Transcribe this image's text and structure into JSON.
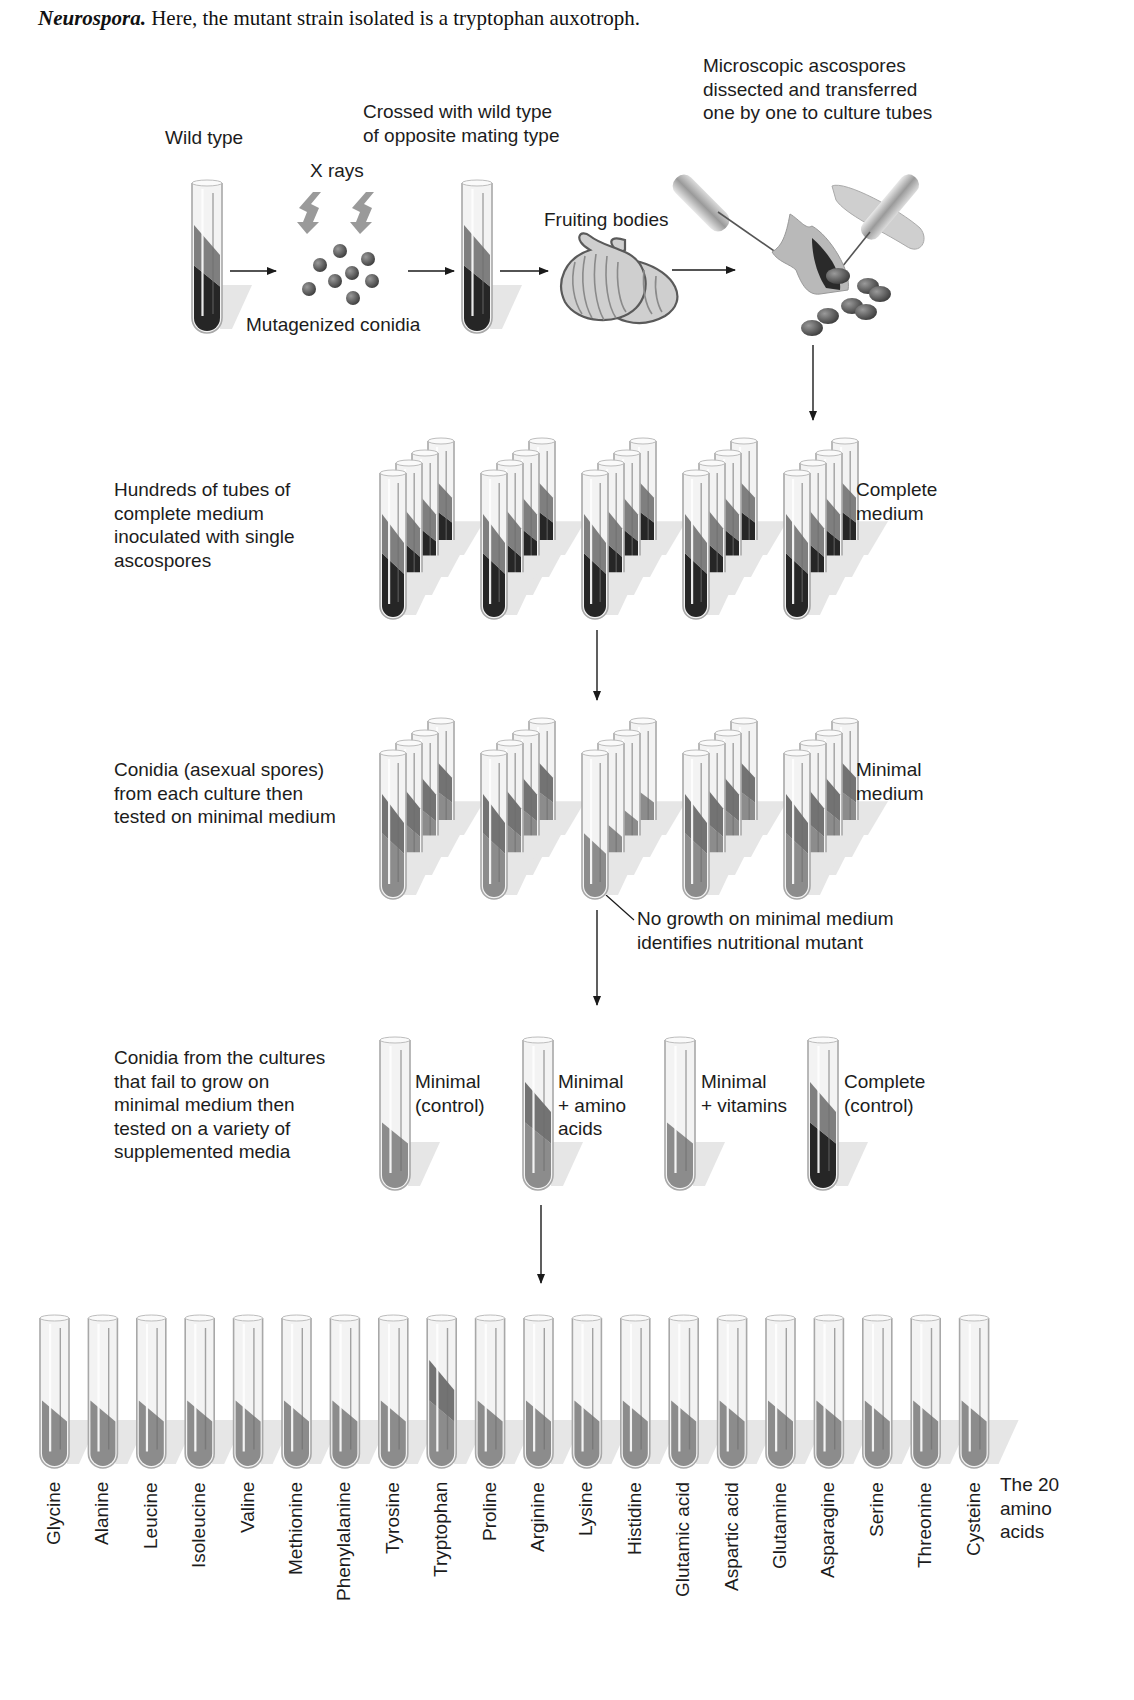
{
  "caption": {
    "italic_bold": "Neurospora.",
    "text": " Here, the mutant strain isolated is a tryptophan auxotroph."
  },
  "step1": {
    "wild_type_label": "Wild type",
    "xrays_label": "X rays",
    "mutagenized_label": "Mutagenized conidia",
    "crossed_label": "Crossed with wild type\nof opposite mating type",
    "fruiting_label": "Fruiting bodies",
    "dissect_label": "Microscopic ascospores\ndissected and transferred\none by one to culture tubes"
  },
  "step2": {
    "description": "Hundreds of tubes of\ncomplete medium\ninoculated with single\nascospores",
    "medium_label": "Complete\nmedium",
    "cluster_count": 5
  },
  "step3": {
    "description": "Conidia (asexual spores)\nfrom each culture then\ntested on minimal medium",
    "medium_label": "Minimal\nmedium",
    "note": "No growth on minimal medium\nidentifies nutritional mutant"
  },
  "step4": {
    "description": "Conidia from the cultures\nthat fail to grow on\nminimal medium then\ntested on a variety of\nsupplemented media",
    "tubes": [
      {
        "label": "Minimal\n(control)",
        "growth": "none"
      },
      {
        "label": "Minimal\n+ amino\nacids",
        "growth": "growth"
      },
      {
        "label": "Minimal\n+ vitamins",
        "growth": "none"
      },
      {
        "label": "Complete\n(control)",
        "growth": "full"
      }
    ]
  },
  "step5": {
    "group_label": "The 20\namino\nacids",
    "amino_acids": [
      {
        "name": "Glycine",
        "growth": false
      },
      {
        "name": "Alanine",
        "growth": false
      },
      {
        "name": "Leucine",
        "growth": false
      },
      {
        "name": "Isoleucine",
        "growth": false
      },
      {
        "name": "Valine",
        "growth": false
      },
      {
        "name": "Methionine",
        "growth": false
      },
      {
        "name": "Phenylalanine",
        "growth": false
      },
      {
        "name": "Tyrosine",
        "growth": false
      },
      {
        "name": "Tryptophan",
        "growth": true
      },
      {
        "name": "Proline",
        "growth": false
      },
      {
        "name": "Arginine",
        "growth": false
      },
      {
        "name": "Lysine",
        "growth": false
      },
      {
        "name": "Histidine",
        "growth": false
      },
      {
        "name": "Glutamic acid",
        "growth": false
      },
      {
        "name": "Aspartic acid",
        "growth": false
      },
      {
        "name": "Glutamine",
        "growth": false
      },
      {
        "name": "Asparagine",
        "growth": false
      },
      {
        "name": "Serine",
        "growth": false
      },
      {
        "name": "Threonine",
        "growth": false
      },
      {
        "name": "Cysteine",
        "growth": false
      }
    ]
  },
  "colors": {
    "ink": "#1a1a1a",
    "medium_gray": "#8a8a8a",
    "growth_dark": "#2b2b2b",
    "glass": "#d9d9d9",
    "shadow": "#e3e3e3",
    "spore": "#555555"
  }
}
